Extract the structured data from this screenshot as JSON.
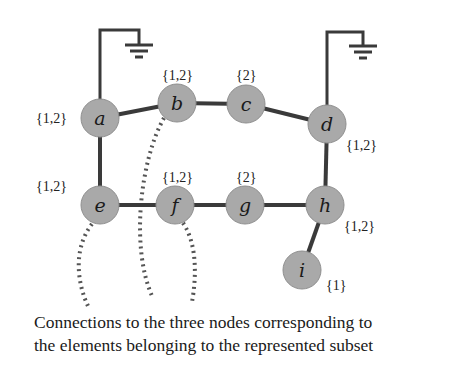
{
  "nodes": [
    {
      "id": "a",
      "label": "a",
      "set": "{1,2}"
    },
    {
      "id": "b",
      "label": "b",
      "set": "{1,2}"
    },
    {
      "id": "c",
      "label": "c",
      "set": "{2}"
    },
    {
      "id": "d",
      "label": "d",
      "set": "{1,2}"
    },
    {
      "id": "e",
      "label": "e",
      "set": "{1,2}"
    },
    {
      "id": "f",
      "label": "f",
      "set": "{1,2}"
    },
    {
      "id": "g",
      "label": "g",
      "set": "{2}"
    },
    {
      "id": "h",
      "label": "h",
      "set": "{1,2}"
    },
    {
      "id": "i",
      "label": "i",
      "set": "{1}"
    }
  ],
  "edges": [
    [
      "a",
      "b"
    ],
    [
      "b",
      "c"
    ],
    [
      "c",
      "d"
    ],
    [
      "a",
      "e"
    ],
    [
      "e",
      "f"
    ],
    [
      "f",
      "g"
    ],
    [
      "g",
      "h"
    ],
    [
      "d",
      "h"
    ],
    [
      "h",
      "i"
    ]
  ],
  "grounded_nodes": [
    "a",
    "d"
  ],
  "subset_connections": [
    "e",
    "b",
    "f"
  ],
  "caption": {
    "line1": "Connections to the three nodes corresponding to",
    "line2": "the elements belonging to the represented subset"
  }
}
